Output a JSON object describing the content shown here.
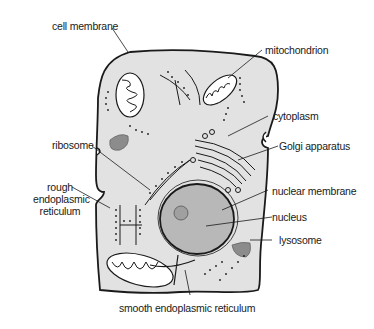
{
  "diagram": {
    "colors": {
      "cytoplasm": "#e2e2e2",
      "outline": "#1a1a1a",
      "nucleus": "#b8b8b8",
      "lysosome": "#8c8c8c",
      "organelle_fill": "#ffffff"
    },
    "labels": {
      "cell_membrane": "cell membrane",
      "mitochondrion": "mitochondrion",
      "cytoplasm": "cytoplasm",
      "golgi_apparatus": "Golgi apparatus",
      "ribosome": "ribosome",
      "rough_er_line1": "rough",
      "rough_er_line2": "endoplasmic",
      "rough_er_line3": "reticulum",
      "nuclear_membrane": "nuclear membrane",
      "nucleus": "nucleus",
      "lysosome": "lysosome",
      "smooth_er": "smooth endoplasmic reticulum"
    }
  }
}
